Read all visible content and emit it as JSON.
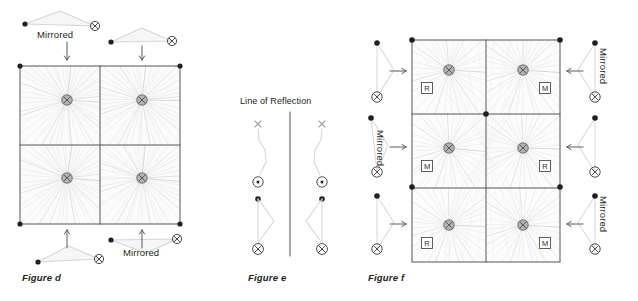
{
  "page": {
    "width": 638,
    "height": 301,
    "background": "#ffffff",
    "ink": "#231f20",
    "line_light": "#d9d9d9",
    "line_mid": "#bfbfbf",
    "line_dark": "#4d4d4d",
    "node_fill": "#b3b3b3",
    "fill_wash": "#f2f2f2"
  },
  "figures": [
    {
      "id": "figure-d",
      "caption": "Figure d",
      "caption_pos": {
        "x": 22,
        "y": 272
      },
      "grid": {
        "x": 20,
        "y": 66,
        "w": 160,
        "h": 158,
        "cols": 2,
        "rows": 2,
        "cell_nodes": [
          {
            "row": 0,
            "col": 0,
            "cx": 67,
            "cy": 100
          },
          {
            "row": 0,
            "col": 1,
            "cx": 142,
            "cy": 100
          },
          {
            "row": 1,
            "col": 0,
            "cx": 67,
            "cy": 178
          },
          {
            "row": 1,
            "col": 1,
            "cx": 142,
            "cy": 178
          }
        ],
        "corner_dots": [
          {
            "x": 20,
            "y": 66
          },
          {
            "x": 180,
            "y": 66
          },
          {
            "x": 20,
            "y": 224
          },
          {
            "x": 180,
            "y": 224
          }
        ]
      },
      "motifs": [
        {
          "name": "motif-top-left",
          "orient": "apex-up",
          "mirrored": true,
          "label": "Mirrored",
          "label_pos": {
            "x": 37,
            "y": 29
          },
          "dot": {
            "x": 25,
            "y": 24
          },
          "cross": {
            "x": 95,
            "y": 26
          },
          "arrow": {
            "x1": 67,
            "y1": 42,
            "x2": 67,
            "y2": 60
          }
        },
        {
          "name": "motif-top-right",
          "orient": "apex-up",
          "mirrored": false,
          "label": "",
          "label_pos": {
            "x": 0,
            "y": 0
          },
          "dot": {
            "x": 111,
            "y": 42
          },
          "cross": {
            "x": 172,
            "y": 41
          },
          "arrow": {
            "x1": 142,
            "y1": 46,
            "x2": 142,
            "y2": 60
          }
        },
        {
          "name": "motif-bottom-left",
          "orient": "apex-up",
          "mirrored": false,
          "label": "",
          "label_pos": {
            "x": 0,
            "y": 0
          },
          "dot": {
            "x": 38,
            "y": 262
          },
          "cross": {
            "x": 99,
            "y": 259
          },
          "arrow": {
            "x1": 67,
            "y1": 248,
            "x2": 67,
            "y2": 230
          }
        },
        {
          "name": "motif-bottom-right",
          "orient": "apex-down",
          "mirrored": true,
          "label": "Mirrored",
          "label_pos": {
            "x": 123,
            "y": 247
          },
          "dot": {
            "x": 111,
            "y": 240
          },
          "cross": {
            "x": 177,
            "y": 239
          },
          "arrow": {
            "x1": 142,
            "y1": 248,
            "x2": 142,
            "y2": 230
          }
        }
      ]
    },
    {
      "id": "figure-e",
      "caption": "Figure e",
      "caption_pos": {
        "x": 248,
        "y": 272
      },
      "axis_label": "Line of Reflection",
      "axis_label_pos": {
        "x": 240,
        "y": 96
      },
      "mirror_line": {
        "x": 290,
        "y1": 112,
        "y2": 256
      },
      "sides": [
        {
          "name": "reflection-shape-left",
          "flip": false,
          "base_x": 258
        },
        {
          "name": "reflection-shape-right",
          "flip": true,
          "base_x": 322
        }
      ],
      "glyphs": {
        "x_mark": "×",
        "circled_dot": "⊙",
        "crossed_circle": "⊗",
        "dot": "•"
      },
      "x_y": 124,
      "circled_dot_y": 182,
      "dot_y": 199,
      "crossed_y": 249
    },
    {
      "id": "figure-f",
      "caption": "Figure f",
      "caption_pos": {
        "x": 368,
        "y": 272
      },
      "grid": {
        "x": 412,
        "y": 40,
        "w": 148,
        "h": 222,
        "cols": 2,
        "rows": 3,
        "cell_nodes": [
          {
            "row": 0,
            "col": 0,
            "cx": 449,
            "cy": 70,
            "tag": "R"
          },
          {
            "row": 0,
            "col": 1,
            "cx": 523,
            "cy": 70,
            "tag": "M"
          },
          {
            "row": 1,
            "col": 0,
            "cx": 449,
            "cy": 148,
            "tag": "M"
          },
          {
            "row": 1,
            "col": 1,
            "cx": 523,
            "cy": 148,
            "tag": "R"
          },
          {
            "row": 2,
            "col": 0,
            "cx": 449,
            "cy": 225,
            "tag": "R"
          },
          {
            "row": 2,
            "col": 1,
            "cx": 523,
            "cy": 225,
            "tag": "M"
          }
        ],
        "corner_dots": [
          {
            "x": 412,
            "y": 40
          },
          {
            "x": 560,
            "y": 40
          },
          {
            "x": 486,
            "y": 114
          },
          {
            "x": 412,
            "y": 187
          },
          {
            "x": 560,
            "y": 187
          }
        ]
      },
      "side_motifs": [
        {
          "name": "motif-left-row1",
          "side": "left",
          "label": "",
          "dot": {
            "x": 377,
            "y": 43
          },
          "cross": {
            "x": 377,
            "y": 97
          },
          "arrow": {
            "x1": 390,
            "y1": 71,
            "x2": 406,
            "y2": 71
          }
        },
        {
          "name": "motif-left-row2",
          "side": "left",
          "label": "Mirrored",
          "label_pos": {
            "x": 386,
            "y": 130
          },
          "dot": {
            "x": 371,
            "y": 118
          },
          "cross": {
            "x": 377,
            "y": 172
          },
          "arrow": {
            "x1": 390,
            "y1": 147,
            "x2": 406,
            "y2": 147
          }
        },
        {
          "name": "motif-left-row3",
          "side": "left",
          "label": "",
          "dot": {
            "x": 377,
            "y": 196
          },
          "cross": {
            "x": 377,
            "y": 249
          },
          "arrow": {
            "x1": 390,
            "y1": 224,
            "x2": 406,
            "y2": 224
          }
        },
        {
          "name": "motif-right-row1",
          "side": "right",
          "label": "Mirrored",
          "label_pos": {
            "x": 609,
            "y": 48
          },
          "dot": {
            "x": 595,
            "y": 43
          },
          "cross": {
            "x": 595,
            "y": 97
          },
          "arrow": {
            "x1": 583,
            "y1": 71,
            "x2": 567,
            "y2": 71
          }
        },
        {
          "name": "motif-right-row2",
          "side": "right",
          "label": "",
          "dot": {
            "x": 595,
            "y": 118
          },
          "cross": {
            "x": 595,
            "y": 172
          },
          "arrow": {
            "x1": 583,
            "y1": 147,
            "x2": 567,
            "y2": 147
          }
        },
        {
          "name": "motif-right-row3",
          "side": "right",
          "label": "Mirrored",
          "label_pos": {
            "x": 609,
            "y": 196
          },
          "dot": {
            "x": 595,
            "y": 196
          },
          "cross": {
            "x": 595,
            "y": 249
          },
          "arrow": {
            "x1": 583,
            "y1": 224,
            "x2": 567,
            "y2": 224
          }
        }
      ]
    }
  ],
  "labels": {
    "mirrored": "Mirrored",
    "line_of_reflection": "Line of Reflection",
    "tag_r": "R",
    "tag_m": "M",
    "caption_d": "Figure d",
    "caption_e": "Figure e",
    "caption_f": "Figure f"
  }
}
